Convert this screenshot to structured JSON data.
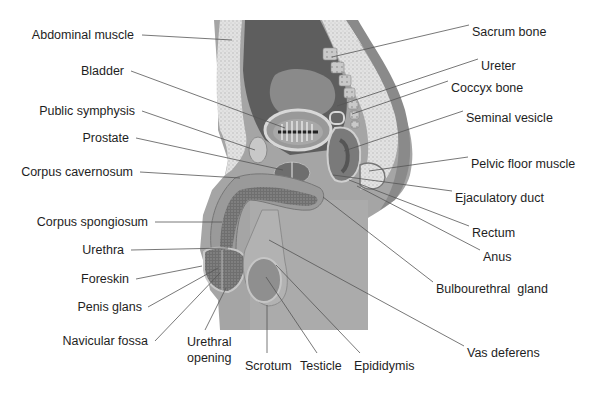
{
  "diagram": {
    "colors": {
      "background": "#ffffff",
      "skin": "#b9b9b9",
      "skin_dark": "#8f8f8f",
      "fat": "#dedede",
      "cavity": "#5f5f5f",
      "bladder_interior": "#878787",
      "bladder_fill": "#a9a9a9",
      "bone": "#c8c8c8",
      "spongy": "#6e6e6e",
      "leader_line": "#555555",
      "text": "#1e1e1e"
    },
    "labels_left": [
      {
        "id": "abdominal-muscle",
        "text": "Abdominal muscle",
        "x": 137,
        "y": 35,
        "tx": 232,
        "ty": 40
      },
      {
        "id": "bladder",
        "text": "Bladder",
        "x": 126,
        "y": 71,
        "tx": 285,
        "ty": 128
      },
      {
        "id": "public-symphysis",
        "text": "Public symphysis",
        "x": 137,
        "y": 111,
        "tx": 255,
        "ty": 150
      },
      {
        "id": "prostate",
        "text": "Prostate",
        "x": 131,
        "y": 138,
        "tx": 283,
        "ty": 170
      },
      {
        "id": "corpus-cavernosum",
        "text": "Corpus cavernosum",
        "x": 135,
        "y": 172,
        "tx": 240,
        "ty": 178
      },
      {
        "id": "corpus-spongiosum",
        "text": "Corpus spongiosum",
        "x": 150,
        "y": 222,
        "tx": 222,
        "ty": 222
      },
      {
        "id": "urethra",
        "text": "Urethra",
        "x": 126,
        "y": 250,
        "tx": 228,
        "ty": 248
      },
      {
        "id": "foreskin",
        "text": "Foreskin",
        "x": 131,
        "y": 279,
        "tx": 202,
        "ty": 266
      },
      {
        "id": "penis-glans",
        "text": "Penis glans",
        "x": 143,
        "y": 307,
        "tx": 218,
        "ty": 268
      },
      {
        "id": "navicular-fossa",
        "text": "Navicular fossa",
        "x": 150,
        "y": 341,
        "tx": 220,
        "ty": 273
      }
    ],
    "labels_bottom": [
      {
        "id": "urethral-opening",
        "text": "Urethral\nopening",
        "x": 188,
        "y": 335,
        "tx": 226,
        "ty": 288
      },
      {
        "id": "scrotum",
        "text": "Scrotum",
        "x": 246,
        "y": 360,
        "tx": 267,
        "ty": 305
      },
      {
        "id": "testicle",
        "text": "Testicle",
        "x": 301,
        "y": 360,
        "tx": 266,
        "ty": 277
      },
      {
        "id": "epididymis",
        "text": "Epididymis",
        "x": 355,
        "y": 360,
        "tx": 276,
        "ty": 265
      }
    ],
    "labels_right": [
      {
        "id": "sacrum-bone",
        "text": "Sacrum bone",
        "x": 472,
        "y": 25,
        "tx": 332,
        "ty": 57
      },
      {
        "id": "ureter",
        "text": "Ureter",
        "x": 481,
        "y": 59,
        "tx": 337,
        "ty": 106
      },
      {
        "id": "coccyx-bone",
        "text": "Coccyx bone",
        "x": 451,
        "y": 81,
        "tx": 352,
        "ty": 114
      },
      {
        "id": "seminal-vesicle",
        "text": "Seminal vesicle",
        "x": 466,
        "y": 111,
        "tx": 344,
        "ty": 151
      },
      {
        "id": "pelvic-floor-muscle",
        "text": "Pelvic floor muscle",
        "x": 471,
        "y": 157,
        "tx": 369,
        "ty": 171
      },
      {
        "id": "ejaculatory-duct",
        "text": "Ejaculatory duct",
        "x": 455,
        "y": 191,
        "tx": 333,
        "ty": 175
      },
      {
        "id": "rectum",
        "text": "Rectum",
        "x": 472,
        "y": 226,
        "tx": 349,
        "ty": 180
      },
      {
        "id": "anus",
        "text": "Anus",
        "x": 483,
        "y": 250,
        "tx": 357,
        "ty": 186
      },
      {
        "id": "bulbourethral-gland",
        "text": "Bulbourethral  gland",
        "x": 436,
        "y": 282,
        "tx": 323,
        "ty": 197
      },
      {
        "id": "vas-deferens",
        "text": "Vas deferens",
        "x": 467,
        "y": 346,
        "tx": 269,
        "ty": 240
      }
    ]
  }
}
